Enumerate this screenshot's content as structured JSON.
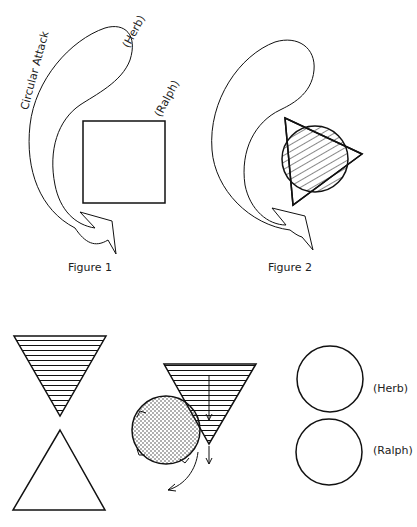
{
  "figure1": {
    "caption": "Figure 1",
    "arrow_label": "Circular Attack",
    "label_top": "(Herb)",
    "label_square": "(Ralph)"
  },
  "figure2": {
    "caption": "Figure 2"
  },
  "bottom": {
    "label_circle_top": "(Herb)",
    "label_circle_bottom": "(Ralph)"
  }
}
